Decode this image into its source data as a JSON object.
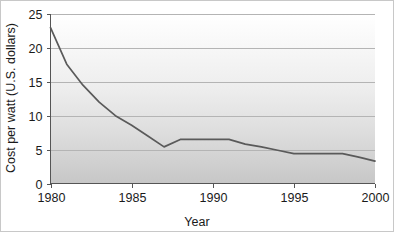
{
  "chart_data": {
    "type": "line",
    "title": "",
    "xlabel": "Year",
    "ylabel": "Cost per watt (U.S. dollars)",
    "xlim": [
      1980,
      2000
    ],
    "ylim": [
      0,
      25
    ],
    "xticks": [
      1980,
      1985,
      1990,
      1995,
      2000
    ],
    "xtick_labels": [
      "1980",
      "1985",
      "1990",
      "1995",
      "2000"
    ],
    "yticks": [
      0,
      5,
      10,
      15,
      20,
      25
    ],
    "ytick_labels": [
      "0",
      "5",
      "10",
      "15",
      "20",
      "25"
    ],
    "grid": "horizontal",
    "legend": "none",
    "line_color": "#5a5a5a",
    "plot_bg_top": "#ffffff",
    "plot_bg_bottom": "#c9c9c9",
    "x": [
      1980,
      1981,
      1982,
      1983,
      1984,
      1985,
      1986,
      1987,
      1988,
      1989,
      1990,
      1991,
      1992,
      1993,
      1994,
      1995,
      1996,
      1997,
      1998,
      1999,
      2000
    ],
    "values": [
      23,
      17.6,
      14.5,
      12,
      10,
      8.6,
      7,
      5.4,
      6.5,
      6.5,
      6.5,
      6.5,
      5.8,
      5.4,
      4.9,
      4.4,
      4.4,
      4.4,
      4.4,
      3.9,
      3.3
    ],
    "series": [
      {
        "name": "Cost per watt",
        "values": [
          23,
          17.6,
          14.5,
          12,
          10,
          8.6,
          7,
          5.4,
          6.5,
          6.5,
          6.5,
          6.5,
          5.8,
          5.4,
          4.9,
          4.4,
          4.4,
          4.4,
          4.4,
          3.9,
          3.3
        ]
      }
    ]
  }
}
